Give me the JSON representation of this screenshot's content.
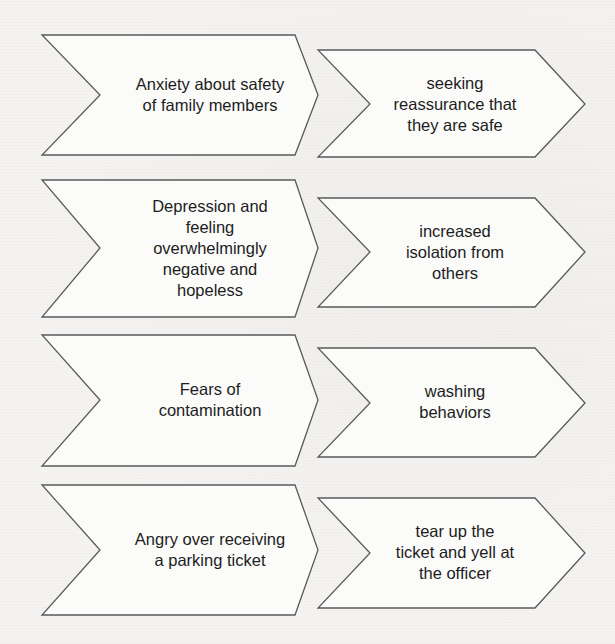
{
  "diagram": {
    "type": "chevron-flow",
    "colors": {
      "background": "#f4f3f1",
      "shape_fill": "#fbfbfa",
      "shape_stroke": "#5a5a5a",
      "text": "#1d1d1d"
    },
    "rows": [
      {
        "trigger": "Anxiety about safety\nof family members",
        "response": "seeking\nreassurance that\nthey are safe"
      },
      {
        "trigger": "Depression and\nfeeling\noverwhelmingly\nnegative and\nhopeless",
        "response": "increased\nisolation from\nothers"
      },
      {
        "trigger": "Fears of\ncontamination",
        "response": "washing\nbehaviors"
      },
      {
        "trigger": "Angry over receiving\na parking ticket",
        "response": "tear up the\nticket and yell at\nthe officer"
      }
    ]
  }
}
